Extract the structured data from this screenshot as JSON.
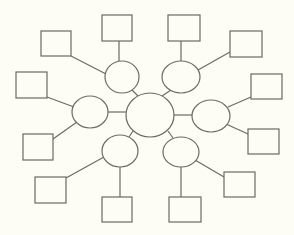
{
  "diagram": {
    "type": "bubble-map",
    "background": "#fdfdf5",
    "stroke_color": "#6b6b66",
    "center": {
      "id": "center",
      "label": "",
      "cx": 150,
      "cy": 115,
      "rx": 24,
      "ry": 22
    },
    "satellites": [
      {
        "id": "upper-left",
        "label": "",
        "cx": 122,
        "cy": 77,
        "rx": 17,
        "ry": 16
      },
      {
        "id": "upper-right",
        "label": "",
        "cx": 181,
        "cy": 77,
        "rx": 19,
        "ry": 16
      },
      {
        "id": "left",
        "label": "",
        "cx": 90,
        "cy": 112,
        "rx": 18,
        "ry": 16
      },
      {
        "id": "right",
        "label": "",
        "cx": 211,
        "cy": 116,
        "rx": 19,
        "ry": 16
      },
      {
        "id": "lower-left",
        "label": "",
        "cx": 120,
        "cy": 151,
        "rx": 18,
        "ry": 16
      },
      {
        "id": "lower-right",
        "label": "",
        "cx": 181,
        "cy": 152,
        "rx": 18,
        "ry": 15
      }
    ],
    "boxes": [
      {
        "id": "box-ul-1",
        "parent": "upper-left",
        "label": "",
        "x": 41,
        "y": 31,
        "w": 30,
        "h": 25
      },
      {
        "id": "box-ul-2",
        "parent": "upper-left",
        "label": "",
        "x": 102,
        "y": 15,
        "w": 30,
        "h": 26
      },
      {
        "id": "box-ur-1",
        "parent": "upper-right",
        "label": "",
        "x": 168,
        "y": 15,
        "w": 32,
        "h": 26
      },
      {
        "id": "box-ur-2",
        "parent": "upper-right",
        "label": "",
        "x": 230,
        "y": 31,
        "w": 32,
        "h": 26
      },
      {
        "id": "box-l-1",
        "parent": "left",
        "label": "",
        "x": 16,
        "y": 72,
        "w": 31,
        "h": 26
      },
      {
        "id": "box-l-2",
        "parent": "left",
        "label": "",
        "x": 23,
        "y": 134,
        "w": 30,
        "h": 26
      },
      {
        "id": "box-r-1",
        "parent": "right",
        "label": "",
        "x": 251,
        "y": 74,
        "w": 31,
        "h": 25
      },
      {
        "id": "box-r-2",
        "parent": "right",
        "label": "",
        "x": 248,
        "y": 129,
        "w": 31,
        "h": 25
      },
      {
        "id": "box-ll-1",
        "parent": "lower-left",
        "label": "",
        "x": 35,
        "y": 177,
        "w": 31,
        "h": 26
      },
      {
        "id": "box-ll-2",
        "parent": "lower-left",
        "label": "",
        "x": 102,
        "y": 197,
        "w": 30,
        "h": 25
      },
      {
        "id": "box-lr-1",
        "parent": "lower-right",
        "label": "",
        "x": 169,
        "y": 197,
        "w": 32,
        "h": 25
      },
      {
        "id": "box-lr-2",
        "parent": "lower-right",
        "label": "",
        "x": 224,
        "y": 172,
        "w": 31,
        "h": 25
      }
    ],
    "edges": [
      {
        "from": "center",
        "to": "upper-left",
        "x1": 138,
        "y1": 96,
        "x2": 132,
        "y2": 90
      },
      {
        "from": "center",
        "to": "upper-right",
        "x1": 162,
        "y1": 96,
        "x2": 171,
        "y2": 90
      },
      {
        "from": "center",
        "to": "left",
        "x1": 126,
        "y1": 112,
        "x2": 108,
        "y2": 112
      },
      {
        "from": "center",
        "to": "right",
        "x1": 174,
        "y1": 115,
        "x2": 192,
        "y2": 115
      },
      {
        "from": "center",
        "to": "lower-left",
        "x1": 133,
        "y1": 131,
        "x2": 129,
        "y2": 137
      },
      {
        "from": "center",
        "to": "lower-right",
        "x1": 168,
        "y1": 131,
        "x2": 173,
        "y2": 138
      },
      {
        "from": "upper-left",
        "to": "box-ul-1",
        "x1": 71,
        "y1": 56,
        "x2": 106,
        "y2": 74
      },
      {
        "from": "upper-left",
        "to": "box-ul-2",
        "x1": 119,
        "y1": 41,
        "x2": 119,
        "y2": 61
      },
      {
        "from": "upper-right",
        "to": "box-ur-1",
        "x1": 181,
        "y1": 41,
        "x2": 181,
        "y2": 61
      },
      {
        "from": "upper-right",
        "to": "box-ur-2",
        "x1": 230,
        "y1": 52,
        "x2": 198,
        "y2": 70
      },
      {
        "from": "left",
        "to": "box-l-1",
        "x1": 47,
        "y1": 97,
        "x2": 74,
        "y2": 107
      },
      {
        "from": "left",
        "to": "box-l-2",
        "x1": 53,
        "y1": 139,
        "x2": 77,
        "y2": 122
      },
      {
        "from": "right",
        "to": "box-r-1",
        "x1": 251,
        "y1": 97,
        "x2": 228,
        "y2": 107
      },
      {
        "from": "right",
        "to": "box-r-2",
        "x1": 248,
        "y1": 134,
        "x2": 226,
        "y2": 124
      },
      {
        "from": "lower-left",
        "to": "box-ll-1",
        "x1": 66,
        "y1": 178,
        "x2": 104,
        "y2": 157
      },
      {
        "from": "lower-left",
        "to": "box-ll-2",
        "x1": 120,
        "y1": 167,
        "x2": 120,
        "y2": 197
      },
      {
        "from": "lower-right",
        "to": "box-lr-1",
        "x1": 181,
        "y1": 167,
        "x2": 181,
        "y2": 197
      },
      {
        "from": "lower-right",
        "to": "box-lr-2",
        "x1": 224,
        "y1": 177,
        "x2": 195,
        "y2": 160
      }
    ]
  }
}
